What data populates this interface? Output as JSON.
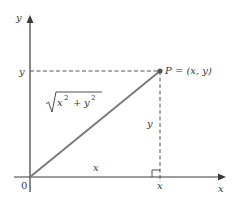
{
  "diagram": {
    "axes": {
      "x_label": "x",
      "y_label": "y",
      "origin_label": "0"
    },
    "point": {
      "label": "P = (x, y)"
    },
    "segments": {
      "hypotenuse_label": "√(x² + y²)",
      "hyp_radicand_x": "x",
      "hyp_radicand_plus": "+",
      "hyp_radicand_y": "y",
      "hyp_exp": "2",
      "base_label": "x",
      "height_label": "y"
    },
    "ticks": {
      "x_tick_label": "x",
      "y_tick_label": "y"
    },
    "colors": {
      "axis": "#3a3a3a",
      "hypotenuse": "#7a7a7a",
      "dashed": "#555555",
      "point": "#555555"
    }
  }
}
